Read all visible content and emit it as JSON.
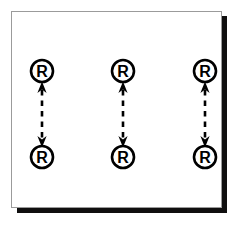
{
  "figure": {
    "type": "diagram",
    "width": 243,
    "height": 231,
    "background_color": "#ffffff"
  },
  "panel": {
    "name": "diagram-frame",
    "fill_color": "#ffffff",
    "border_color": "#9b9b9b",
    "border_width": 1,
    "shadow_color": "#100f0f",
    "x": 11,
    "y": 11,
    "width": 211,
    "height": 197
  },
  "nodes": [
    {
      "id": "r-top-left",
      "label": "R",
      "cx": 42,
      "cy": 71,
      "r": 11,
      "row": "top",
      "column": 1
    },
    {
      "id": "r-top-center",
      "label": "R",
      "cx": 123,
      "cy": 71,
      "r": 11,
      "row": "top",
      "column": 2
    },
    {
      "id": "r-top-right",
      "label": "R",
      "cx": 205,
      "cy": 71,
      "r": 11,
      "row": "top",
      "column": 3
    },
    {
      "id": "r-bottom-left",
      "label": "R",
      "cx": 42,
      "cy": 157,
      "r": 11,
      "row": "bottom",
      "column": 1
    },
    {
      "id": "r-bottom-center",
      "label": "R",
      "cx": 123,
      "cy": 157,
      "r": 11,
      "row": "bottom",
      "column": 2
    },
    {
      "id": "r-bottom-right",
      "label": "R",
      "cx": 205,
      "cy": 157,
      "r": 11,
      "row": "bottom",
      "column": 3
    }
  ],
  "connectors": [
    {
      "id": "connector-left",
      "x": 42,
      "y_top": 82,
      "y_bottom": 146,
      "style": "dashed",
      "heads": "both",
      "color": "#000000"
    },
    {
      "id": "connector-center",
      "x": 123,
      "y_top": 82,
      "y_bottom": 146,
      "style": "dashed",
      "heads": "both",
      "color": "#000000"
    },
    {
      "id": "connector-right",
      "x": 205,
      "y_top": 82,
      "y_bottom": 146,
      "style": "dashed",
      "heads": "both",
      "color": "#000000"
    }
  ],
  "legend": {
    "node_label": "R",
    "arrow_description": "bidirectional dashed arrow"
  }
}
